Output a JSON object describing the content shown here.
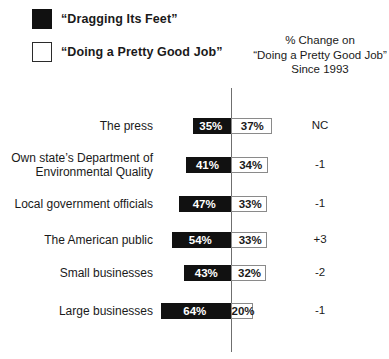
{
  "legend": {
    "items": [
      {
        "label": "“Dragging Its Feet”",
        "swatch": "filled-square-icon",
        "color": "#111111"
      },
      {
        "label": "“Doing a Pretty Good Job”",
        "swatch": "hollow-square-icon",
        "color": "#ffffff"
      }
    ]
  },
  "change_header": {
    "line1": "% Change on",
    "line2": "“Doing a Pretty Good Job”",
    "line3": "Since 1993"
  },
  "rows": [
    {
      "label": "The press",
      "dragging": "35%",
      "good_job": "37%",
      "change": "NC"
    },
    {
      "label": "Own state’s Department of\nEnvironmental Quality",
      "dragging": "41%",
      "good_job": "34%",
      "change": "-1"
    },
    {
      "label": "Local government officials",
      "dragging": "47%",
      "good_job": "33%",
      "change": "-1"
    },
    {
      "label": "The American public",
      "dragging": "54%",
      "good_job": "33%",
      "change": "+3"
    },
    {
      "label": "Small businesses",
      "dragging": "43%",
      "good_job": "32%",
      "change": "-2"
    },
    {
      "label": "Large businesses",
      "dragging": "64%",
      "good_job": "20%",
      "change": "-1"
    }
  ],
  "chart_data": {
    "type": "bar",
    "orientation": "horizontal-diverging",
    "title": "",
    "xlabel": "",
    "ylabel": "",
    "categories": [
      "The press",
      "Own state's Department of Environmental Quality",
      "Local government officials",
      "The American public",
      "Small businesses",
      "Large businesses"
    ],
    "series": [
      {
        "name": "“Dragging Its Feet”",
        "color": "#111111",
        "direction": "left",
        "values": [
          35,
          41,
          47,
          54,
          43,
          64
        ]
      },
      {
        "name": "“Doing a Pretty Good Job”",
        "color": "#ffffff",
        "direction": "right",
        "values": [
          37,
          34,
          33,
          33,
          32,
          20
        ]
      }
    ],
    "annotations": {
      "column_header": "% Change on “Doing a Pretty Good Job” Since 1993",
      "values": [
        "NC",
        "-1",
        "-1",
        "+3",
        "-2",
        "-1"
      ]
    },
    "units": "percent",
    "grid": false,
    "legend_position": "top-left",
    "axis_center": 0,
    "px_per_unit": 1.1
  },
  "geometry": {
    "row_centers": [
      126,
      165,
      204,
      240,
      273,
      311
    ],
    "label_center_offsets": [
      0,
      -7,
      0,
      0,
      0,
      0
    ]
  }
}
